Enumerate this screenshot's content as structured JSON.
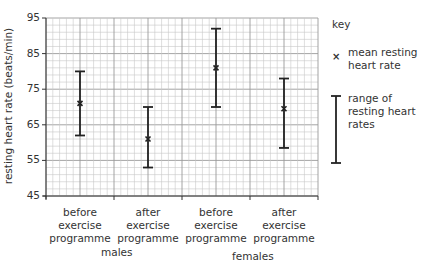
{
  "chart_data": {
    "type": "errorbar",
    "title": "",
    "xlabel": "",
    "ylabel": "resting heart rate (beats/min)",
    "ylim": [
      45,
      95
    ],
    "yticks": [
      45,
      55,
      65,
      75,
      85,
      95
    ],
    "grid": true,
    "categories": [
      "before exercise programme",
      "after exercise programme",
      "before exercise programme",
      "after exercise programme"
    ],
    "groups": [
      {
        "name": "males",
        "categories": [
          0,
          1
        ]
      },
      {
        "name": "females",
        "categories": [
          2,
          3
        ]
      }
    ],
    "series": [
      {
        "name": "mean resting heart rate",
        "marker": "x",
        "values": [
          71,
          61,
          81,
          69.5
        ]
      },
      {
        "name": "range of resting heart rates",
        "min": [
          62,
          53,
          70,
          58.5
        ],
        "max": [
          80,
          70,
          92,
          78
        ]
      }
    ],
    "legend": {
      "position": "right",
      "title": "key"
    }
  },
  "axis": {
    "ylabel": "resting heart rate (beats/min)",
    "yticks": [
      "95",
      "85",
      "75",
      "65",
      "55",
      "45"
    ]
  },
  "xlabels": [
    [
      "before",
      "exercise",
      "programme"
    ],
    [
      "after",
      "exercise",
      "programme"
    ],
    [
      "before",
      "exercise",
      "programme"
    ],
    [
      "after",
      "exercise",
      "programme"
    ]
  ],
  "groups": {
    "males": "males",
    "females": "females"
  },
  "legend": {
    "title": "key",
    "mean_icon": "×",
    "mean_label": "mean resting heart rate",
    "range_label": "range of resting heart rates"
  },
  "colors": {
    "grid_minor": "#c8c8c8",
    "grid_major": "#9a9a9a",
    "bar": "#222222",
    "axis": "#333333"
  }
}
